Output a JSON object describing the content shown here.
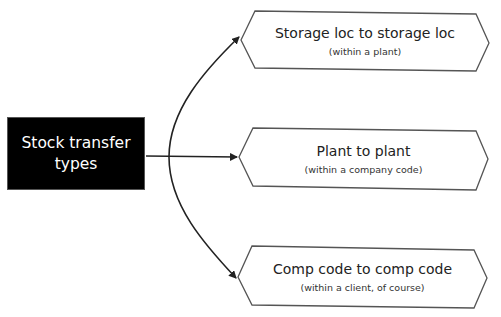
{
  "source": {
    "line1": "Stock transfer",
    "line2": "types"
  },
  "targets": [
    {
      "title": "Storage loc to storage loc",
      "subtitle": "(within a plant)"
    },
    {
      "title": "Plant to plant",
      "subtitle": "(within a company code)"
    },
    {
      "title": "Comp code to comp code",
      "subtitle": "(within a client, of course)"
    }
  ],
  "colors": {
    "source_bg": "#000000",
    "source_text": "#ffffff",
    "connector": "#222222",
    "hex_border": "#555555"
  }
}
